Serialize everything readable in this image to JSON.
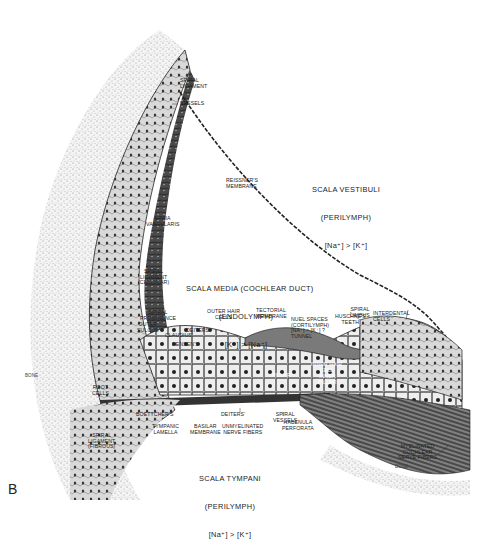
{
  "figure": {
    "panel_label": "B",
    "colors": {
      "background": "#ffffff",
      "ink": "#1a1a1a",
      "bone_stipple": "#9a9a9a",
      "tissue_shade": "#555555"
    }
  },
  "compartments": {
    "scala_vestibuli": {
      "name": "SCALA VESTIBULI",
      "fluid": "(PERILYMPH)",
      "ion": "[Na⁺] > [K⁺]"
    },
    "scala_media": {
      "name": "SCALA MEDIA (COCHLEAR DUCT)",
      "fluid": "(ENDOLYMPH)",
      "ion": "[K⁺] > [Na⁺]"
    },
    "scala_tympani": {
      "name": "SCALA TYMPANI",
      "fluid": "(PERILYMPH)",
      "ion": "[Na⁺] > [K⁺]"
    }
  },
  "labels": {
    "spiral_ligament": "SPIRAL\nLIGAMENT",
    "vessels": "VESSELS",
    "reissners_membrane": "REISSNER'S\nMEMBRANE",
    "stria_vascularis": "STRIA\nVASCULARIS",
    "spiral_ligament_cellular": "SPIRAL\nLIGAMENT\n(CELLULAR)",
    "spiral_prominence": "SPIRAL\nPROMINENCE",
    "outer_sulcus": "OUTER\nSULCUS",
    "claudius": "CLAUDIUS'",
    "deiters_upper": "DEITERS'",
    "hensens": "HENSEN'S",
    "outer_hair_cells": "OUTER HAIR\nCELLS",
    "tectorial_membrane": "TECTORIAL\nMEMBRANE",
    "nuel_spaces": "NUEL SPACES\n(CORTILYMPH)\n[Na⁺] > [K⁺] ?\nTUNNEL",
    "spiral_limbus": "SPIRAL\nLIMBUS",
    "huschkes_teeth": "HUSCHKE'S\nTEETH",
    "interdental_cells": "INTERDENTAL\nCELLS",
    "inner_hair_cell": "INNER HAIR\nCELL",
    "inner_pillar": "INNER\nPILLAR",
    "pillar": "PILLAR",
    "root_cells": "ROOT\nCELLS",
    "boettchers": "BOETTCHER'S",
    "deiters_lower": "DEITERS'",
    "spiral_vessels": "SPIRAL\nVESSELS",
    "tympanic_lamella": "TYMPANIC\nLAMELLA",
    "basilar_membrane": "BASILAR\nMEMBRANE",
    "unmyelinated_nerve_fibers": "UNMYELINATED\nNERVE FIBERS",
    "habenula_perforata": "HABENULA\nPERFORATA",
    "spiral_ligament_fibrous": "SPIRAL\nLIGAMENT\n(FIBROUS)",
    "myelinated_cochlear_nerve_fibers": "MYELINATED\nCOCHLEAR\nNERVE FIBERS",
    "bone_left": "BONE",
    "bone_right": "BONE"
  }
}
